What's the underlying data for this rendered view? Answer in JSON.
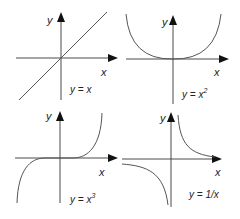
{
  "graphs": [
    {
      "id": "linear",
      "position": "top-left",
      "equation": "y = x",
      "equation_base": "y = x",
      "equation_exp": "",
      "x_label": "x",
      "y_label": "y"
    },
    {
      "id": "quadratic",
      "position": "top-right",
      "equation": "y = x^2",
      "equation_base": "y = x",
      "equation_exp": "2",
      "x_label": "x",
      "y_label": "y"
    },
    {
      "id": "cubic",
      "position": "bottom-left",
      "equation": "y = x^3",
      "equation_base": "y = x",
      "equation_exp": "3",
      "x_label": "x",
      "y_label": "y"
    },
    {
      "id": "reciprocal",
      "position": "bottom-right",
      "equation": "y = 1/x",
      "equation_base": "y = 1/x",
      "equation_exp": "",
      "x_label": "x",
      "y_label": "y"
    }
  ],
  "colors": {
    "axis": "#4a4a4a",
    "curve": "#555555",
    "arrow": "#111111",
    "text": "#222222",
    "background": "#ffffff"
  }
}
